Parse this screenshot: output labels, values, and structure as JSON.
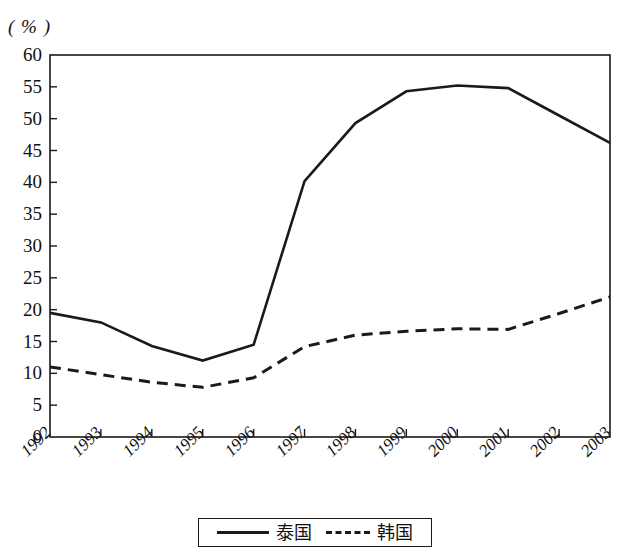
{
  "chart_data": {
    "type": "line",
    "title": "",
    "subtitle": "",
    "unit_label": "( % )",
    "xlabel": "",
    "ylabel": "",
    "x": [
      "1992",
      "1993",
      "1994",
      "1995",
      "1996",
      "1997",
      "1998",
      "1999",
      "2000",
      "2001",
      "2002",
      "2003"
    ],
    "categories": [
      "1992",
      "1993",
      "1994",
      "1995",
      "1996",
      "1997",
      "1998",
      "1999",
      "2000",
      "2001",
      "2002",
      "2003"
    ],
    "series": [
      {
        "name": "泰国",
        "style": "solid",
        "color": "#1a1a1a",
        "values": [
          19.5,
          18.0,
          14.3,
          12.0,
          14.5,
          40.2,
          49.3,
          54.3,
          55.2,
          54.8,
          50.5,
          46.2
        ]
      },
      {
        "name": "韩国",
        "style": "dashed",
        "color": "#1a1a1a",
        "values": [
          11.0,
          9.8,
          8.6,
          7.8,
          9.3,
          14.2,
          16.0,
          16.6,
          17.0,
          16.9,
          19.4,
          22.0
        ]
      }
    ],
    "ylim": [
      0,
      60
    ],
    "ytick_step": 5,
    "yticks": [
      60,
      55,
      50,
      45,
      40,
      35,
      30,
      25,
      20,
      15,
      10,
      5,
      0
    ],
    "xtick_labels": [
      "1992",
      "1993",
      "1994",
      "1995",
      "1996",
      "1997",
      "1998",
      "1999",
      "2000",
      "2001",
      "2002",
      "2003"
    ],
    "grid": false,
    "legend_position": "bottom-center",
    "legend": [
      {
        "label": "泰国",
        "style": "solid"
      },
      {
        "label": "韩国",
        "style": "dashed"
      }
    ]
  }
}
